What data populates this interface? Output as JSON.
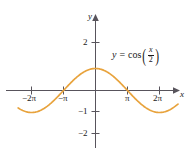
{
  "chart_data": {
    "type": "line",
    "title": "",
    "xlabel": "x",
    "ylabel": "y",
    "equation_label": "y = cos(x/2)",
    "equation_parts": {
      "lhs": "y",
      "equals": "=",
      "function": "cos",
      "numerator": "x",
      "denominator": "2"
    },
    "xlim": [
      -7.6,
      8.1
    ],
    "ylim": [
      -2.45,
      2.6
    ],
    "x_ticks": [
      -6.283185,
      -3.141593,
      3.141593,
      6.283185
    ],
    "x_tick_labels": [
      "−2π",
      "−π",
      "π",
      "2π"
    ],
    "y_ticks": [
      2,
      -1,
      -2
    ],
    "y_tick_labels": [
      "2",
      "−1",
      "−2"
    ],
    "grid": false,
    "legend": "none",
    "curve_color": "#e8a33d",
    "axis_color": "#58545c",
    "series": [
      {
        "name": "y = cos(x/2)",
        "amplitude": 1,
        "period": 12.566371,
        "zeros": [
          -3.141593,
          3.141593
        ],
        "maxima": [
          {
            "x": 0,
            "y": 1
          }
        ],
        "minima": [
          {
            "x": -6.283185,
            "y": -1
          },
          {
            "x": 6.283185,
            "y": -1
          }
        ],
        "x": [
          -7.6,
          -7.2,
          -6.8,
          -6.4,
          -6.0,
          -5.6,
          -5.2,
          -4.8,
          -4.4,
          -4.0,
          -3.6,
          -3.2,
          -2.8,
          -2.4,
          -2.0,
          -1.6,
          -1.2,
          -0.8,
          -0.4,
          0.0,
          0.4,
          0.8,
          1.2,
          1.6,
          2.0,
          2.4,
          2.8,
          3.2,
          3.6,
          4.0,
          4.4,
          4.8,
          5.2,
          5.6,
          6.0,
          6.4,
          6.8,
          7.2,
          7.6
        ],
        "y": [
          -0.98,
          -0.99,
          -1.0,
          -1.0,
          -0.99,
          -0.96,
          -0.92,
          -0.87,
          -0.8,
          -0.72,
          -0.62,
          -0.51,
          -0.4,
          -0.28,
          -0.15,
          -0.03,
          0.1,
          0.23,
          0.35,
          0.47,
          0.58,
          0.68,
          0.77,
          0.85,
          0.91,
          0.96,
          0.99,
          1.0,
          0.99,
          0.96,
          0.91,
          0.85,
          0.77,
          0.68,
          0.58,
          0.47,
          0.35,
          0.23,
          0.1
        ]
      }
    ]
  },
  "labels": {
    "x_axis_name": "x",
    "y_axis_name": "y",
    "tick_x_neg2pi": "−2π",
    "tick_x_negpi": "−π",
    "tick_x_pi": "π",
    "tick_x_2pi": "2π",
    "tick_y_2": "2",
    "tick_y_neg1": "−1",
    "tick_y_neg2": "−2"
  }
}
